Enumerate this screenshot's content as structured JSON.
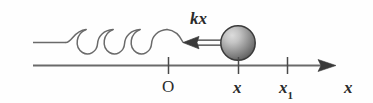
{
  "figure": {
    "background_color": "#fefefe",
    "stroke_color": "#5a5a5a",
    "text_color": "#2b2b2b",
    "labels": {
      "force": "kx",
      "origin": "O",
      "position": "x",
      "position_max": "x",
      "position_max_subscript": "1",
      "axis": "x"
    },
    "geometry": {
      "wall_x": 33,
      "axis_y": 65,
      "axis_start_x": 33,
      "axis_arrow_tip_x": 336,
      "spring_axis_y": 42,
      "ball_center_x": 238,
      "ball_center_y": 43,
      "ball_radius": 17,
      "force_arrow_tip_x": 183,
      "force_arrow_tail_x": 222,
      "tick_origin_x": 168,
      "tick_position_x": 238,
      "tick_position_max_x": 287,
      "coil_count": 3
    },
    "colors": {
      "line": "#5a5a5a",
      "ball_highlight": "#d2d2d2",
      "ball_shadow": "#5e5e5e",
      "ball_outline": "#3a3a3a",
      "arrow_fill": "#3a3a3a"
    }
  }
}
